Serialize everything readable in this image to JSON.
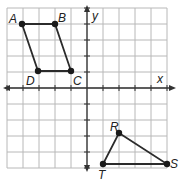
{
  "diagram": {
    "type": "coordinate-grid",
    "axes": {
      "x_label": "x",
      "y_label": "y"
    },
    "grid": {
      "x_min": -5,
      "x_max": 5,
      "y_min": -5,
      "y_max": 5,
      "cell_px": 16,
      "origin_px": [
        87,
        88
      ]
    },
    "colors": {
      "grid": "#b8b8b8",
      "axis": "#333333",
      "shape": "#2b2b2b",
      "point": "#1a1a1a",
      "background": "#ffffff"
    },
    "parallelogram": {
      "name": "ABCD",
      "vertices": [
        {
          "label": "A",
          "x": -4,
          "y": 4
        },
        {
          "label": "B",
          "x": -2,
          "y": 4
        },
        {
          "label": "C",
          "x": -1,
          "y": 1
        },
        {
          "label": "D",
          "x": -3,
          "y": 1
        }
      ]
    },
    "triangle": {
      "name": "RST",
      "vertices": [
        {
          "label": "R",
          "x": 2,
          "y": -3
        },
        {
          "label": "S",
          "x": 5,
          "y": -5
        },
        {
          "label": "T",
          "x": 1,
          "y": -5
        }
      ]
    }
  }
}
